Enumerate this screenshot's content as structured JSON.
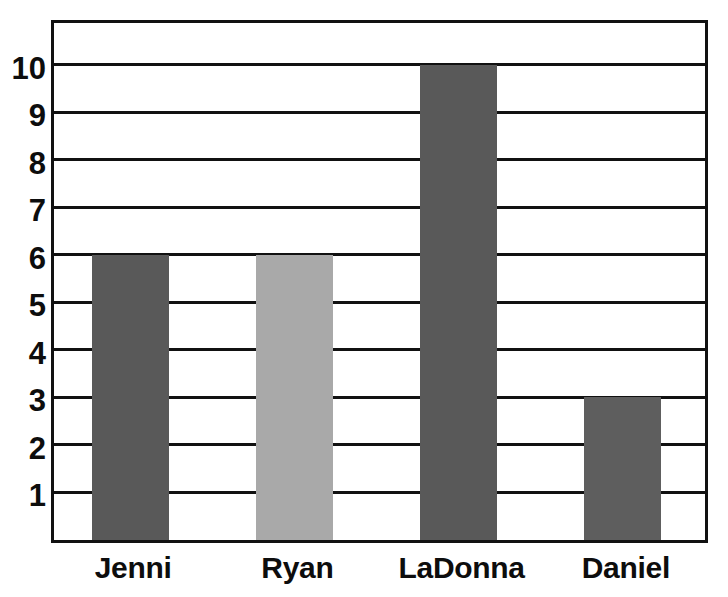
{
  "chart_data": {
    "type": "bar",
    "title": "",
    "subtitle": "",
    "xlabel": "",
    "ylabel": "",
    "categories": [
      "Jenni",
      "Ryan",
      "LaDonna",
      "Daniel"
    ],
    "values": [
      6,
      6,
      10,
      3
    ],
    "bar_colors": [
      "#595959",
      "#a9a9a9",
      "#595959",
      "#5e5e5e"
    ],
    "ylim": [
      0,
      11
    ],
    "y_ticks": [
      1,
      2,
      3,
      4,
      5,
      6,
      7,
      8,
      9,
      10
    ],
    "y_tick_labels": [
      "1",
      "2",
      "3",
      "4",
      "5",
      "6",
      "7",
      "8",
      "9",
      "10"
    ],
    "grid": true,
    "grid_axis": "y",
    "legend": false,
    "legend_position": "none",
    "annotations": []
  },
  "style": {
    "background": "#ffffff",
    "axis_color": "#111111",
    "grid_color": "#111111",
    "label_color": "#0d0d0d",
    "bar_dark": "#595959",
    "bar_light": "#a9a9a9"
  }
}
